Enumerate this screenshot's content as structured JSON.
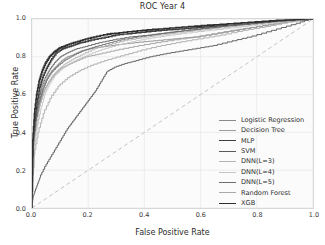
{
  "chart_data": {
    "type": "line",
    "title": "ROC Year 4",
    "xlabel": "False Positive Rate",
    "ylabel": "True Positive Rate",
    "xlim": [
      0.0,
      1.0
    ],
    "ylim": [
      0.0,
      1.0
    ],
    "xticks": [
      "0.0",
      "0.2",
      "0.4",
      "0.6",
      "0.8",
      "1.0"
    ],
    "yticks": [
      "0.0",
      "0.2",
      "0.4",
      "0.6",
      "0.8",
      "1.0"
    ],
    "xtick_values": [
      0.0,
      0.2,
      0.4,
      0.6,
      0.8,
      1.0
    ],
    "ytick_values": [
      0.0,
      0.2,
      0.4,
      0.6,
      0.8,
      1.0
    ],
    "grid": true,
    "legend_position": "lower right",
    "reference_line": {
      "name": "chance-diagonal",
      "style": "dashed",
      "color": "#bdbdbd",
      "x": [
        0.0,
        1.0
      ],
      "y": [
        0.0,
        1.0
      ]
    },
    "series": [
      {
        "name": "Logistic Regression",
        "color": "#8a8a8a",
        "width": 0.9,
        "x": [
          0.0,
          0.005,
          0.01,
          0.02,
          0.03,
          0.04,
          0.05,
          0.06,
          0.07,
          0.09,
          0.11,
          0.13,
          0.15,
          0.18,
          0.22,
          0.27,
          0.32,
          0.38,
          0.45,
          0.52,
          0.6,
          0.68,
          0.76,
          0.84,
          0.92,
          1.0
        ],
        "y": [
          0.0,
          0.3,
          0.42,
          0.52,
          0.58,
          0.63,
          0.67,
          0.7,
          0.72,
          0.75,
          0.78,
          0.8,
          0.81,
          0.83,
          0.845,
          0.855,
          0.865,
          0.875,
          0.885,
          0.895,
          0.905,
          0.925,
          0.945,
          0.965,
          0.985,
          1.0
        ]
      },
      {
        "name": "Decision Tree",
        "color": "#9c9c9c",
        "width": 0.9,
        "x": [
          0.0,
          0.01,
          0.02,
          0.03,
          0.045,
          0.06,
          0.08,
          0.1,
          0.13,
          0.16,
          0.2,
          0.25,
          0.31,
          0.38,
          0.46,
          0.55,
          0.64,
          0.73,
          0.82,
          0.91,
          1.0
        ],
        "y": [
          0.0,
          0.38,
          0.48,
          0.56,
          0.62,
          0.66,
          0.7,
          0.73,
          0.755,
          0.775,
          0.8,
          0.815,
          0.835,
          0.855,
          0.875,
          0.895,
          0.915,
          0.94,
          0.96,
          0.98,
          1.0
        ]
      },
      {
        "name": "MLP",
        "color": "#3f3f3f",
        "width": 1.5,
        "x": [
          0.0,
          0.005,
          0.012,
          0.02,
          0.03,
          0.04,
          0.055,
          0.07,
          0.09,
          0.11,
          0.14,
          0.17,
          0.21,
          0.26,
          0.31,
          0.37,
          0.44,
          0.52,
          0.61,
          0.7,
          0.8,
          0.9,
          1.0
        ],
        "y": [
          0.0,
          0.34,
          0.46,
          0.56,
          0.64,
          0.69,
          0.74,
          0.78,
          0.82,
          0.84,
          0.855,
          0.87,
          0.885,
          0.9,
          0.915,
          0.925,
          0.935,
          0.945,
          0.955,
          0.965,
          0.975,
          0.99,
          1.0
        ]
      },
      {
        "name": "SVM",
        "color": "#5a5a5a",
        "width": 0.9,
        "x": [
          0.0,
          0.006,
          0.014,
          0.025,
          0.035,
          0.05,
          0.065,
          0.085,
          0.105,
          0.13,
          0.16,
          0.2,
          0.25,
          0.3,
          0.36,
          0.43,
          0.51,
          0.6,
          0.69,
          0.79,
          0.89,
          1.0
        ],
        "y": [
          0.0,
          0.36,
          0.47,
          0.57,
          0.63,
          0.69,
          0.73,
          0.77,
          0.8,
          0.82,
          0.84,
          0.855,
          0.875,
          0.89,
          0.905,
          0.915,
          0.93,
          0.945,
          0.96,
          0.975,
          0.99,
          1.0
        ]
      },
      {
        "name": "DNN(L=3)",
        "color": "#b4b4b4",
        "width": 0.9,
        "x": [
          0.0,
          0.008,
          0.018,
          0.03,
          0.045,
          0.06,
          0.08,
          0.1,
          0.125,
          0.155,
          0.19,
          0.235,
          0.285,
          0.34,
          0.4,
          0.47,
          0.55,
          0.64,
          0.73,
          0.83,
          0.92,
          1.0
        ],
        "y": [
          0.0,
          0.32,
          0.44,
          0.54,
          0.61,
          0.66,
          0.705,
          0.735,
          0.765,
          0.79,
          0.815,
          0.845,
          0.865,
          0.885,
          0.9,
          0.915,
          0.93,
          0.945,
          0.96,
          0.975,
          0.99,
          1.0
        ]
      },
      {
        "name": "DNN(L=4)",
        "color": "#c4c4c4",
        "width": 0.9,
        "x": [
          0.0,
          0.009,
          0.02,
          0.033,
          0.048,
          0.065,
          0.085,
          0.11,
          0.14,
          0.175,
          0.215,
          0.26,
          0.31,
          0.37,
          0.44,
          0.51,
          0.59,
          0.68,
          0.77,
          0.86,
          0.94,
          1.0
        ],
        "y": [
          0.0,
          0.3,
          0.42,
          0.52,
          0.6,
          0.655,
          0.7,
          0.735,
          0.765,
          0.79,
          0.815,
          0.84,
          0.86,
          0.88,
          0.9,
          0.915,
          0.93,
          0.945,
          0.96,
          0.975,
          0.99,
          1.0
        ]
      },
      {
        "name": "DNN(L=5)",
        "color": "#6e6e6e",
        "width": 0.9,
        "x": [
          0.0,
          0.007,
          0.016,
          0.028,
          0.04,
          0.055,
          0.072,
          0.095,
          0.12,
          0.15,
          0.185,
          0.225,
          0.275,
          0.33,
          0.39,
          0.46,
          0.54,
          0.63,
          0.72,
          0.82,
          0.91,
          1.0
        ],
        "y": [
          0.0,
          0.35,
          0.46,
          0.555,
          0.62,
          0.675,
          0.715,
          0.75,
          0.78,
          0.805,
          0.83,
          0.85,
          0.87,
          0.89,
          0.905,
          0.92,
          0.935,
          0.95,
          0.965,
          0.98,
          0.99,
          1.0
        ]
      },
      {
        "name": "Random Forest",
        "color": "#a8a8a8",
        "width": 0.9,
        "x": [
          0.0,
          0.01,
          0.025,
          0.045,
          0.07,
          0.1,
          0.135,
          0.175,
          0.22,
          0.27,
          0.33,
          0.39,
          0.46,
          0.53,
          0.61,
          0.69,
          0.77,
          0.85,
          0.93,
          1.0
        ],
        "y": [
          0.0,
          0.28,
          0.4,
          0.5,
          0.58,
          0.645,
          0.69,
          0.725,
          0.755,
          0.78,
          0.805,
          0.83,
          0.855,
          0.875,
          0.895,
          0.915,
          0.94,
          0.96,
          0.985,
          1.0
        ]
      },
      {
        "name": "XGB",
        "color": "#2e2e2e",
        "width": 1.6,
        "x": [
          0.0,
          0.004,
          0.01,
          0.018,
          0.027,
          0.037,
          0.05,
          0.065,
          0.082,
          0.1,
          0.125,
          0.155,
          0.19,
          0.23,
          0.28,
          0.34,
          0.41,
          0.49,
          0.58,
          0.67,
          0.77,
          0.87,
          1.0
        ],
        "y": [
          0.0,
          0.36,
          0.5,
          0.6,
          0.67,
          0.72,
          0.765,
          0.8,
          0.825,
          0.845,
          0.86,
          0.875,
          0.89,
          0.905,
          0.92,
          0.93,
          0.94,
          0.95,
          0.96,
          0.97,
          0.98,
          0.99,
          1.0
        ]
      },
      {
        "name": "Lowest Curve",
        "color": "#555555",
        "width": 0.9,
        "x": [
          0.0,
          0.005,
          0.01,
          0.02,
          0.03,
          0.05,
          0.07,
          0.09,
          0.11,
          0.13,
          0.15,
          0.17,
          0.19,
          0.21,
          0.23,
          0.25,
          0.27,
          0.3,
          0.34,
          0.38,
          0.43,
          0.48,
          0.54,
          0.6,
          0.66,
          0.73,
          0.8,
          0.87,
          0.94,
          1.0
        ],
        "y": [
          0.0,
          0.06,
          0.08,
          0.12,
          0.16,
          0.22,
          0.27,
          0.32,
          0.37,
          0.42,
          0.46,
          0.5,
          0.54,
          0.58,
          0.62,
          0.67,
          0.72,
          0.745,
          0.765,
          0.78,
          0.8,
          0.815,
          0.83,
          0.845,
          0.86,
          0.885,
          0.91,
          0.94,
          0.97,
          1.0
        ]
      }
    ]
  }
}
